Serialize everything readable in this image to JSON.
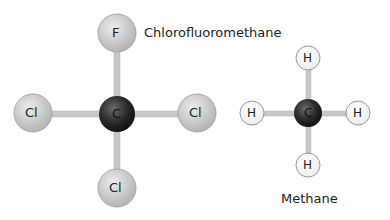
{
  "molecules": [
    {
      "name": "Chloromethane",
      "label": "Chlorofluoromethane",
      "center": {
        "symbol": "C"
      },
      "atoms": [
        {
          "symbol": "F",
          "position": "top"
        },
        {
          "symbol": "Cl",
          "position": "left"
        },
        {
          "symbol": "Cl",
          "position": "right"
        },
        {
          "symbol": "Cl",
          "position": "bottom"
        }
      ]
    },
    {
      "name": "Methane",
      "label": "Methane",
      "center": {
        "symbol": "C"
      },
      "atoms": [
        {
          "symbol": "H",
          "position": "top"
        },
        {
          "symbol": "H",
          "position": "left"
        },
        {
          "symbol": "H",
          "position": "right"
        },
        {
          "symbol": "H",
          "position": "bottom"
        }
      ]
    }
  ],
  "colors": {
    "carbon": "#2a2a2a",
    "halogen": "#c8c8c8",
    "hydrogen": "#ffffff",
    "bond": "#c4c4c4"
  }
}
